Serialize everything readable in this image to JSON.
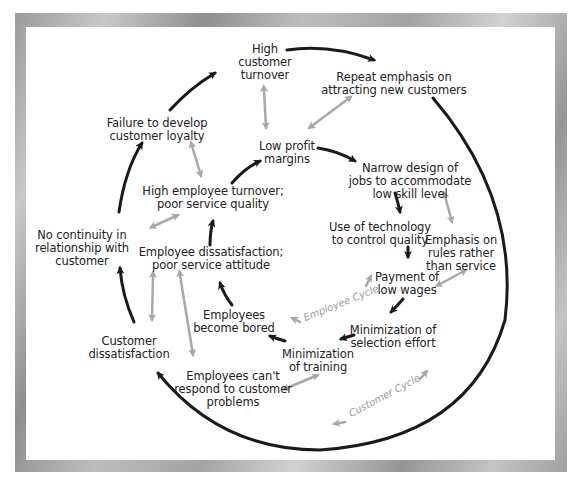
{
  "diagram": {
    "type": "cycle-diagram",
    "colors": {
      "causal_arrow": "#1a1a1a",
      "association_arrow": "#a8a8a8",
      "frame": "#a6a6a6",
      "panel": "#ffffff",
      "text": "#222222",
      "cycle_label": "#9a9a9a"
    },
    "nodes": {
      "high_customer_turnover": "High\ncustomer\nturnover",
      "repeat_emphasis": "Repeat emphasis on\nattracting new customers",
      "failure_loyalty": "Failure to develop\ncustomer loyalty",
      "low_profit": "Low profit\nmargins",
      "narrow_design": "Narrow design of\njobs to accommodate\nlow skill level",
      "high_employee_turnover": "High employee turnover;\npoor service quality",
      "use_technology": "Use of technology\nto control quality",
      "emphasis_rules": "Emphasis on\nrules rather\nthan service",
      "no_continuity": "No continuity in\nrelationship with\ncustomer",
      "employee_dissatisfaction": "Employee dissatisfaction;\npoor service attitude",
      "payment_low_wages": "Payment of\nlow wages",
      "employees_bored": "Employees\nbecome bored",
      "min_selection": "Minimization of\nselection effort",
      "customer_dissatisfaction": "Customer\ndissatisfaction",
      "min_training": "Minimization\nof training",
      "employees_cant_respond": "Employees can't\nrespond to customer\nproblems"
    },
    "cycle_labels": {
      "employee_cycle": "Employee Cycle",
      "customer_cycle": "Customer Cycle"
    },
    "arrow_icons": {
      "causal": "black-arrow-icon",
      "association": "gray-double-arrow-icon"
    }
  }
}
